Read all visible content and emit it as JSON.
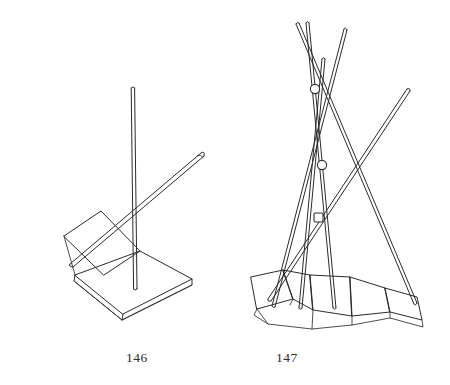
{
  "page": {
    "background_color": "#ffffff",
    "ink_color": "#2b2b2b",
    "width": 450,
    "height": 385,
    "kind": "technical-line-drawing"
  },
  "figures": [
    {
      "caption": "146",
      "name": "tilted-plate-stand-with-rods",
      "description": "Line drawing of a stand: a flat horizontal quadrilateral base plate with visible thickness, a smaller plate tilted up at the back left, one tall vertical rod rising from the base, and one slanted rod crossing it diagonally from lower left to upper right.",
      "rod_count": 2,
      "plate_count": 2
    },
    {
      "caption": "147",
      "name": "splayed-rod-bundle-on-curved-segmented-base",
      "description": "Line drawing of five thin rods crossing through three small collar rings, splaying outward and downward to rest on a curved base built from five trapezoidal plates hinged in an arc.",
      "rod_count": 5,
      "ring_count": 3,
      "base_segment_count": 5
    }
  ]
}
